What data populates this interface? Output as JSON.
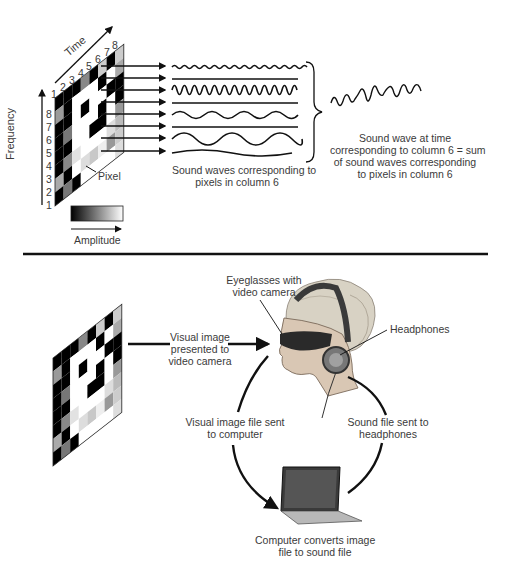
{
  "top_panel": {
    "axis_time_label": "Time",
    "axis_frequency_label": "Frequency",
    "time_ticks": [
      "1",
      "2",
      "3",
      "4",
      "5",
      "6",
      "7",
      "8"
    ],
    "frequency_ticks": [
      "8",
      "7",
      "6",
      "5",
      "4",
      "3",
      "2",
      "1"
    ],
    "pixel_label": "Pixel",
    "amplitude_label": "Amplitude",
    "waves_caption_line1": "Sound waves corresponding to",
    "waves_caption_line2": "pixels in column 6",
    "sum_caption_line1": "Sound wave at time",
    "sum_caption_line2": "corresponding to column 6 = sum",
    "sum_caption_line3": "of sound waves corresponding",
    "sum_caption_line4": "to pixels in column 6",
    "grid_columns": 8,
    "grid_rows": 8,
    "highlighted_column": 6
  },
  "bottom_panel": {
    "visual_image_label_line1": "Visual image",
    "visual_image_label_line2": "presented to",
    "visual_image_label_line3": "video camera",
    "eyeglasses_label_line1": "Eyeglasses with",
    "eyeglasses_label_line2": "video camera",
    "headphones_label": "Headphones",
    "image_file_label_line1": "Visual image file sent",
    "image_file_label_line2": "to computer",
    "sound_file_label_line1": "Sound file sent to",
    "sound_file_label_line2": "headphones",
    "computer_label_line1": "Computer converts image",
    "computer_label_line2": "file to sound file"
  },
  "colors": {
    "ink": "#111111",
    "text": "#3a3a3a",
    "skin": "#d9c7b4",
    "hair": "#d8d2c4"
  }
}
